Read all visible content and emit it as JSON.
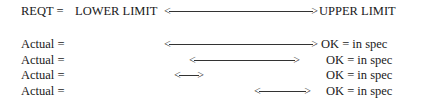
{
  "header": {
    "label": "REQT =",
    "lower_limit": "LOWER LIMIT",
    "upper_limit": "UPPER LIMIT",
    "arrow_left_head": "<",
    "arrow_right_head": ">"
  },
  "rows": [
    {
      "label": "Actual =",
      "result": "OK = in spec",
      "arrow": {
        "x1": 166,
        "x2": 316
      }
    },
    {
      "label": "Actual =",
      "result": "OK = in spec",
      "arrow": {
        "x1": 191,
        "x2": 298
      }
    },
    {
      "label": "Actual =",
      "result": "OK = in spec",
      "arrow": {
        "x1": 176,
        "x2": 202
      }
    },
    {
      "label": "Actual =",
      "result": "OK = in spec",
      "arrow": {
        "x1": 256,
        "x2": 309
      }
    }
  ],
  "arrow_heads": {
    "left": "<",
    "right": ">"
  }
}
